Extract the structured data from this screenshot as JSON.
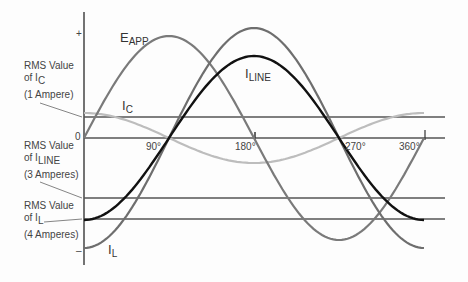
{
  "chart_data": {
    "type": "line",
    "title": "",
    "xlabel": "Phase angle",
    "ylabel": "",
    "x_ticks": [
      "90°",
      "180°",
      "270°",
      "360°"
    ],
    "y_markers": {
      "plus": "+",
      "zero": "0",
      "minus": "–"
    },
    "series": [
      {
        "name": "E_APP",
        "shape": "sine",
        "phase_deg": 0,
        "amplitude_rel": 1.0,
        "color": "#7a7a7a"
      },
      {
        "name": "I_C",
        "shape": "cosine",
        "amplitude_amp": 1.41,
        "color": "#bdbdbd"
      },
      {
        "name": "I_L",
        "shape": "-cosine",
        "amplitude_amp": 5.66,
        "color": "#6e6e6e"
      },
      {
        "name": "I_LINE",
        "shape": "-cosine",
        "amplitude_amp": 4.24,
        "color": "#111111"
      }
    ],
    "rms_lines": [
      {
        "label": "RMS Value of I_C (1 Ampere)",
        "value": 1
      },
      {
        "label": "RMS Value of I_LINE (3 Amperes)",
        "value": -3
      },
      {
        "label": "RMS Value of I_L (4 Amperes)",
        "value": -4
      }
    ]
  },
  "labels": {
    "eapp": {
      "main": "E",
      "sub": "APP"
    },
    "iline": {
      "main": "I",
      "sub": "LINE"
    },
    "ic": {
      "main": "I",
      "sub": "C"
    },
    "il": {
      "main": "I",
      "sub": "L"
    },
    "plus": "+",
    "zero": "0",
    "minus": "–",
    "deg90": "90°",
    "deg180": "180°",
    "deg270": "270°",
    "deg360": "360°",
    "rms_ic": {
      "line1": "RMS Value",
      "line2a": "of I",
      "line2sub": "C",
      "line3": "(1 Ampere)"
    },
    "rms_iline": {
      "line1": "RMS Value",
      "line2a": "of I",
      "line2sub": "LINE",
      "line3": "(3 Amperes)"
    },
    "rms_il": {
      "line1": "RMS Value",
      "line2a": "of I",
      "line2sub": "L",
      "line3": "(4 Amperes)"
    }
  }
}
